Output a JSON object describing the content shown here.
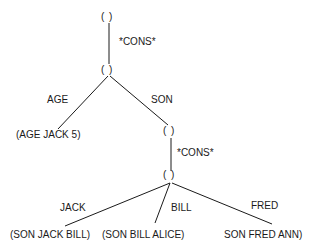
{
  "diagram": {
    "type": "tree",
    "nodes": [
      {
        "id": "n1",
        "label": "( )"
      },
      {
        "id": "n2",
        "label": "( )"
      },
      {
        "id": "n3",
        "label": "( )"
      },
      {
        "id": "n4",
        "label": "( )"
      }
    ],
    "edges": [
      {
        "from": "n1",
        "to": "n2",
        "label": "*CONS*"
      },
      {
        "from": "n2",
        "to": "leaf_age",
        "label": "AGE"
      },
      {
        "from": "n2",
        "to": "n3",
        "label": "SON"
      },
      {
        "from": "n3",
        "to": "n4",
        "label": "*CONS*"
      },
      {
        "from": "n4",
        "to": "leaf_jack",
        "label": "JACK"
      },
      {
        "from": "n4",
        "to": "leaf_bill",
        "label": "BILL"
      },
      {
        "from": "n4",
        "to": "leaf_fred",
        "label": "FRED"
      }
    ],
    "leaves": {
      "age": "(AGE JACK 5)",
      "jack": "(SON JACK BILL)",
      "bill": "(SON BILL ALICE)",
      "fred": "SON FRED ANN)"
    }
  }
}
